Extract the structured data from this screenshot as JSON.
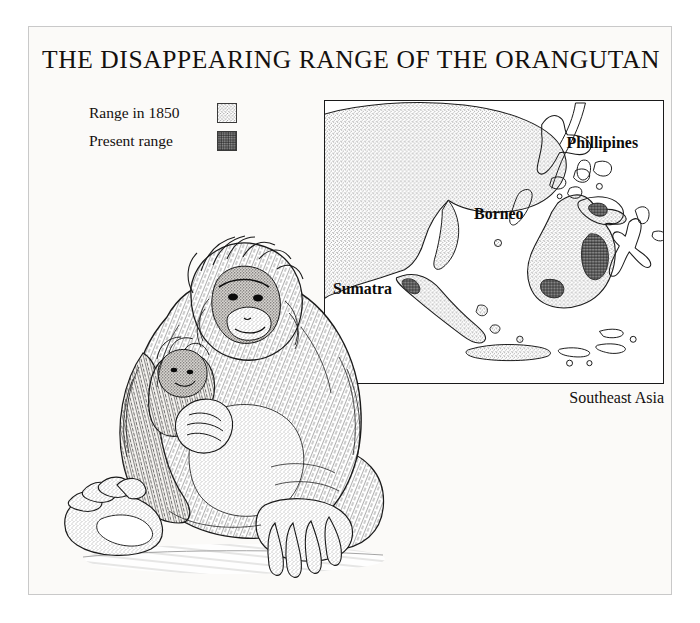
{
  "poster": {
    "title": "THE DISAPPEARING RANGE OF THE ORANGUTAN",
    "background_color": "#fbfaf8",
    "ink_color": "#14100e",
    "frame_color": "#c9c9c9"
  },
  "legend": {
    "items": [
      {
        "label": "Range in 1850",
        "swatch": "stipple-light-swatch",
        "pattern": "light stipple"
      },
      {
        "label": "Present range",
        "swatch": "crosshatch-dark-swatch",
        "pattern": "dense cross-hatch"
      }
    ]
  },
  "map": {
    "caption": "Southeast Asia",
    "border_color": "#1a1a1a",
    "labels": [
      {
        "name": "Phillipines",
        "x": 243,
        "y": 47
      },
      {
        "name": "Borneo",
        "x": 150,
        "y": 119
      },
      {
        "name": "Sumatra",
        "x": 12,
        "y": 191
      }
    ],
    "regions": [
      {
        "name": "mainland-southeast-asia",
        "fill": "range-1850"
      },
      {
        "name": "sumatra-island",
        "fill": "range-1850"
      },
      {
        "name": "borneo-island",
        "fill": "range-1850"
      },
      {
        "name": "java-island",
        "fill": "range-1850"
      },
      {
        "name": "philippines-islands",
        "fill": "none"
      },
      {
        "name": "sulawesi-island",
        "fill": "none"
      },
      {
        "name": "borneo-present-range-central",
        "fill": "present-range"
      },
      {
        "name": "borneo-present-range-south",
        "fill": "present-range"
      },
      {
        "name": "borneo-present-range-north",
        "fill": "present-range"
      },
      {
        "name": "sumatra-present-range-north",
        "fill": "present-range"
      }
    ]
  },
  "illustration": {
    "subject": "mother orangutan holding infant",
    "style": "pen-and-ink stipple engraving",
    "alt": "Seated adult orangutan cradling a young orangutan, legs extended forward"
  }
}
